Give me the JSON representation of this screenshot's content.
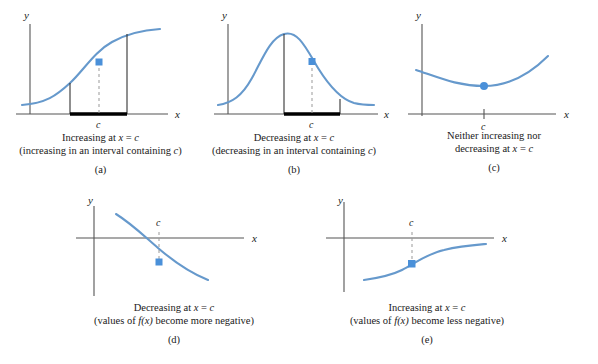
{
  "figure": {
    "axis_labels": {
      "x": "x",
      "y": "y",
      "c": "c"
    },
    "colors": {
      "curve": "#6699cc",
      "point": "#4a90d9",
      "axis": "#555555",
      "interval_bar": "#000000",
      "dashed": "#999999",
      "background": "#ffffff"
    }
  },
  "panels": [
    {
      "id": "a",
      "letter": "(a)",
      "caption_line1_pre": "Increasing at ",
      "caption_line1_var": "x",
      "caption_line1_mid": " = ",
      "caption_line1_c": "c",
      "caption_line2_pre": "(increasing in an interval containing ",
      "caption_line2_c": "c",
      "caption_line2_post": ")",
      "x_label": "x",
      "y_label": "y",
      "c_label": "c",
      "has_interval_bar": true,
      "has_dashed_drop": true,
      "point_shape": "square",
      "curve_shape": "sigmoid-increasing"
    },
    {
      "id": "b",
      "letter": "(b)",
      "caption_line1_pre": "Decreasing at ",
      "caption_line1_var": "x",
      "caption_line1_mid": " = ",
      "caption_line1_c": "c",
      "caption_line2_pre": "(decreasing in an interval containing ",
      "caption_line2_c": "c",
      "caption_line2_post": ")",
      "x_label": "x",
      "y_label": "y",
      "c_label": "c",
      "has_interval_bar": true,
      "has_dashed_drop": true,
      "point_shape": "square",
      "curve_shape": "bell"
    },
    {
      "id": "c",
      "letter": "(c)",
      "caption_line1_pre": "Neither increasing nor",
      "caption_line1_var": "",
      "caption_line1_mid": "",
      "caption_line1_c": "",
      "caption_line2_pre": "decreasing at ",
      "caption_line2_var": "x",
      "caption_line2_mid": " = ",
      "caption_line2_c": "c",
      "caption_line2_post": "",
      "x_label": "x",
      "y_label": "y",
      "c_label": "c",
      "has_interval_bar": false,
      "has_dashed_drop": false,
      "point_shape": "circle",
      "curve_shape": "parabola-minimum"
    },
    {
      "id": "d",
      "letter": "(d)",
      "caption_line1_pre": "Decreasing at ",
      "caption_line1_var": "x",
      "caption_line1_mid": " = ",
      "caption_line1_c": "c",
      "caption_line2_pre": "(values of ",
      "caption_line2_f": "f",
      "caption_line2_fx": "(x)",
      "caption_line2_post": " become more negative)",
      "x_label": "x",
      "y_label": "y",
      "c_label": "c",
      "has_interval_bar": false,
      "has_dashed_drop": true,
      "point_shape": "square",
      "curve_shape": "decay-decreasing-below-axis"
    },
    {
      "id": "e",
      "letter": "(e)",
      "caption_line1_pre": "Increasing at ",
      "caption_line1_var": "x",
      "caption_line1_mid": " = ",
      "caption_line1_c": "c",
      "caption_line2_pre": "(values of ",
      "caption_line2_f": "f",
      "caption_line2_fx": "(x)",
      "caption_line2_post": " become less negative)",
      "x_label": "x",
      "y_label": "y",
      "c_label": "c",
      "has_interval_bar": false,
      "has_dashed_drop": true,
      "point_shape": "square",
      "curve_shape": "sigmoid-increasing-below-axis"
    }
  ]
}
